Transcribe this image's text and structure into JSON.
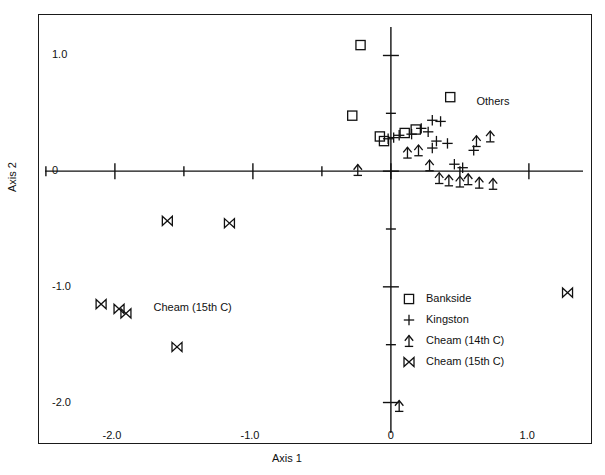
{
  "chart_data": {
    "type": "scatter",
    "title": "",
    "xlabel": "Axis 1",
    "ylabel": "Axis 2",
    "xlim": [
      -2.55,
      1.45
    ],
    "ylim": [
      -2.35,
      1.35
    ],
    "grid": false,
    "xticks": [
      -2.0,
      -1.0,
      0,
      1.0
    ],
    "xtick_labels": [
      "-2.0",
      "-1.0",
      "0",
      "1.0"
    ],
    "yticks": [
      -2.0,
      -1.0,
      0,
      1.0
    ],
    "ytick_labels": [
      "-2.0",
      "-1.0",
      "0",
      "1.0"
    ],
    "minor_xticks": [
      -2.5,
      -1.5,
      -0.5,
      0.5,
      1.5
    ],
    "minor_yticks": [
      -1.5,
      -0.5,
      0.5
    ],
    "legend_position": "lower-right",
    "annotations": [
      {
        "text": "Others",
        "x": 0.62,
        "y": 0.6
      },
      {
        "text": "Cheam (15th C)",
        "x": -1.72,
        "y": -1.18
      }
    ],
    "series": [
      {
        "name": "Bankside",
        "marker": "square",
        "points": [
          {
            "x": -0.22,
            "y": 1.09
          },
          {
            "x": -0.28,
            "y": 0.48
          },
          {
            "x": 0.43,
            "y": 0.64
          },
          {
            "x": 0.18,
            "y": 0.36
          },
          {
            "x": 0.1,
            "y": 0.33
          },
          {
            "x": -0.08,
            "y": 0.3
          },
          {
            "x": -0.05,
            "y": 0.26
          }
        ]
      },
      {
        "name": "Kingston",
        "marker": "plus",
        "points": [
          {
            "x": 0.3,
            "y": 0.44
          },
          {
            "x": 0.36,
            "y": 0.43
          },
          {
            "x": 0.22,
            "y": 0.37
          },
          {
            "x": 0.27,
            "y": 0.34
          },
          {
            "x": 0.15,
            "y": 0.32
          },
          {
            "x": 0.06,
            "y": 0.31
          },
          {
            "x": 0.02,
            "y": 0.29
          },
          {
            "x": -0.02,
            "y": 0.28
          },
          {
            "x": 0.33,
            "y": 0.26
          },
          {
            "x": 0.41,
            "y": 0.24
          },
          {
            "x": 0.3,
            "y": 0.2
          },
          {
            "x": 0.6,
            "y": 0.18
          },
          {
            "x": 0.46,
            "y": 0.06
          },
          {
            "x": 0.52,
            "y": 0.03
          }
        ]
      },
      {
        "name": "Cheam (14th C)",
        "marker": "arrow-up",
        "points": [
          {
            "x": 0.72,
            "y": 0.3
          },
          {
            "x": 0.62,
            "y": 0.26
          },
          {
            "x": 0.2,
            "y": 0.18
          },
          {
            "x": 0.12,
            "y": 0.16
          },
          {
            "x": 0.28,
            "y": 0.05
          },
          {
            "x": -0.24,
            "y": 0.01
          },
          {
            "x": 0.35,
            "y": -0.06
          },
          {
            "x": 0.42,
            "y": -0.08
          },
          {
            "x": 0.5,
            "y": -0.09
          },
          {
            "x": 0.56,
            "y": -0.07
          },
          {
            "x": 0.64,
            "y": -0.1
          },
          {
            "x": 0.74,
            "y": -0.11
          },
          {
            "x": 0.06,
            "y": -2.03
          }
        ]
      },
      {
        "name": "Cheam (15th C)",
        "marker": "bowtie",
        "points": [
          {
            "x": -1.62,
            "y": -0.43
          },
          {
            "x": -1.17,
            "y": -0.45
          },
          {
            "x": -2.1,
            "y": -1.15
          },
          {
            "x": -1.97,
            "y": -1.19
          },
          {
            "x": -1.92,
            "y": -1.23
          },
          {
            "x": -1.55,
            "y": -1.52
          },
          {
            "x": 1.28,
            "y": -1.05
          }
        ]
      }
    ]
  },
  "legend": {
    "items": [
      {
        "label": "Bankside",
        "marker": "square"
      },
      {
        "label": "Kingston",
        "marker": "plus"
      },
      {
        "label": "Cheam (14th C)",
        "marker": "arrow-up"
      },
      {
        "label": "Cheam (15th C)",
        "marker": "bowtie"
      }
    ]
  }
}
